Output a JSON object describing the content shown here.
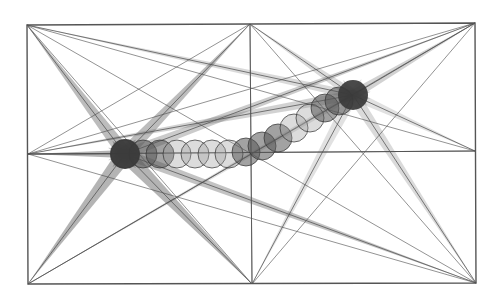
{
  "diagram": {
    "type": "geometric-construction",
    "background": "#ffffff",
    "frame": {
      "corners": {
        "top_left": [
          27,
          25
        ],
        "top_right": [
          475,
          23
        ],
        "bottom_left": [
          28,
          284
        ],
        "bottom_right": [
          476,
          283
        ]
      },
      "top_mid": [
        250,
        24
      ],
      "bottom_mid": [
        252,
        284
      ],
      "left_mid": [
        28,
        154
      ],
      "right_mid": [
        475,
        151
      ],
      "stroke": "#555555"
    },
    "nodes": {
      "start": {
        "center": [
          125,
          154
        ],
        "radius": 15,
        "fill": "#3a3a3a"
      },
      "end": {
        "center": [
          353,
          95
        ],
        "radius": 15,
        "fill": "#3a3a3a"
      }
    },
    "circle_path": {
      "count": 14,
      "radius": 14,
      "points": [
        [
          125,
          154
        ],
        [
          143,
          154
        ],
        [
          160,
          154
        ],
        [
          177,
          154
        ],
        [
          195,
          154
        ],
        [
          212,
          154
        ],
        [
          229,
          154
        ],
        [
          246,
          152
        ],
        [
          262,
          146
        ],
        [
          278,
          138
        ],
        [
          294,
          128
        ],
        [
          310,
          118
        ],
        [
          325,
          108
        ],
        [
          339,
          101
        ]
      ],
      "fill_dark": "#555555",
      "fill_light": "#9a9a9a",
      "outline": "#333333"
    },
    "beams": [
      {
        "from": [
          27,
          25
        ],
        "to": [
          125,
          154
        ],
        "width": 14,
        "opacity": 0.45
      },
      {
        "from": [
          250,
          24
        ],
        "to": [
          125,
          154
        ],
        "width": 14,
        "opacity": 0.45
      },
      {
        "from": [
          28,
          284
        ],
        "to": [
          125,
          154
        ],
        "width": 16,
        "opacity": 0.5
      },
      {
        "from": [
          252,
          284
        ],
        "to": [
          125,
          154
        ],
        "width": 16,
        "opacity": 0.5
      },
      {
        "from": [
          28,
          154
        ],
        "to": [
          125,
          154
        ],
        "width": 8,
        "opacity": 0.5
      },
      {
        "from": [
          476,
          283
        ],
        "to": [
          125,
          154
        ],
        "width": 10,
        "opacity": 0.4
      },
      {
        "from": [
          475,
          23
        ],
        "to": [
          125,
          154
        ],
        "width": 10,
        "opacity": 0.35
      },
      {
        "from": [
          475,
          23
        ],
        "to": [
          353,
          95
        ],
        "width": 10,
        "opacity": 0.3
      },
      {
        "from": [
          27,
          25
        ],
        "to": [
          353,
          95
        ],
        "width": 8,
        "opacity": 0.25
      },
      {
        "from": [
          250,
          24
        ],
        "to": [
          353,
          95
        ],
        "width": 10,
        "opacity": 0.25
      },
      {
        "from": [
          475,
          151
        ],
        "to": [
          353,
          95
        ],
        "width": 10,
        "opacity": 0.2
      },
      {
        "from": [
          476,
          283
        ],
        "to": [
          353,
          95
        ],
        "width": 12,
        "opacity": 0.25
      },
      {
        "from": [
          252,
          284
        ],
        "to": [
          353,
          95
        ],
        "width": 12,
        "opacity": 0.2
      },
      {
        "from": [
          28,
          154
        ],
        "to": [
          353,
          95
        ],
        "width": 10,
        "opacity": 0.3
      },
      {
        "from": [
          28,
          284
        ],
        "to": [
          353,
          95
        ],
        "width": 6,
        "opacity": 0.2
      }
    ],
    "thin_lines": [
      {
        "from": [
          27,
          25
        ],
        "to": [
          476,
          283
        ]
      },
      {
        "from": [
          28,
          284
        ],
        "to": [
          475,
          23
        ]
      },
      {
        "from": [
          27,
          25
        ],
        "to": [
          252,
          284
        ]
      },
      {
        "from": [
          250,
          24
        ],
        "to": [
          476,
          283
        ]
      },
      {
        "from": [
          250,
          24
        ],
        "to": [
          28,
          154
        ]
      },
      {
        "from": [
          252,
          284
        ],
        "to": [
          475,
          23
        ]
      },
      {
        "from": [
          28,
          154
        ],
        "to": [
          475,
          23
        ]
      },
      {
        "from": [
          28,
          154
        ],
        "to": [
          476,
          283
        ]
      },
      {
        "from": [
          250,
          24
        ],
        "to": [
          252,
          284
        ]
      },
      {
        "from": [
          28,
          154
        ],
        "to": [
          475,
          151
        ]
      },
      {
        "from": [
          27,
          25
        ],
        "to": [
          475,
          151
        ]
      }
    ],
    "beam_color": "#6a6a6a",
    "line_color": "#4a4a4a"
  }
}
